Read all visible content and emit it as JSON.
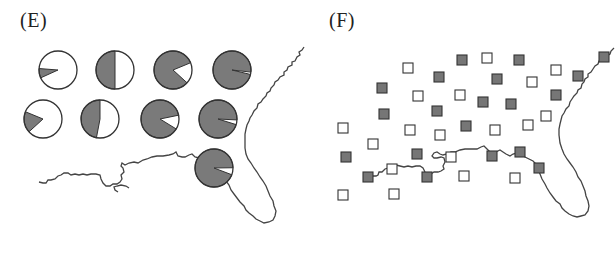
{
  "panels": {
    "e": {
      "label": "(E)",
      "description": "Pie chart markers over a coastline map of the southeastern US; gray = allele/trait frequency fraction, white = remainder",
      "colors": {
        "filled": "#7a7a7a",
        "empty": "#ffffff",
        "stroke": "#333333",
        "coast": "#444444"
      },
      "pies": [
        {
          "cx": 58,
          "cy": 70,
          "r": 19,
          "gray_fraction": 0.08,
          "gray_start_deg": 180
        },
        {
          "cx": 115,
          "cy": 70,
          "r": 19,
          "gray_fraction": 0.5,
          "gray_start_deg": 90
        },
        {
          "cx": 173,
          "cy": 70,
          "r": 19,
          "gray_fraction": 0.82,
          "gray_start_deg": 0
        },
        {
          "cx": 232,
          "cy": 70,
          "r": 19,
          "gray_fraction": 0.98,
          "gray_start_deg": 0
        },
        {
          "cx": 43,
          "cy": 119,
          "r": 19,
          "gray_fraction": 0.18,
          "gray_start_deg": 180
        },
        {
          "cx": 100,
          "cy": 119,
          "r": 19,
          "gray_fraction": 0.47,
          "gray_start_deg": 90
        },
        {
          "cx": 160,
          "cy": 119,
          "r": 19,
          "gray_fraction": 0.88,
          "gray_start_deg": 0
        },
        {
          "cx": 218,
          "cy": 119,
          "r": 19,
          "gray_fraction": 0.96,
          "gray_start_deg": 0
        },
        {
          "cx": 214,
          "cy": 168,
          "r": 19,
          "gray_fraction": 0.94,
          "gray_start_deg": 0
        }
      ]
    },
    "f": {
      "label": "(F)",
      "description": "Square markers over the same coastline map; filled gray squares vs open white squares, randomly interspersed",
      "colors": {
        "filled": "#767676",
        "empty": "#ffffff",
        "stroke": "#333333",
        "coast": "#444444"
      },
      "square_size": 10,
      "squares": [
        {
          "x": 98,
          "y": 63,
          "filled": false
        },
        {
          "x": 152,
          "y": 55,
          "filled": true
        },
        {
          "x": 177,
          "y": 53,
          "filled": false
        },
        {
          "x": 209,
          "y": 55,
          "filled": true
        },
        {
          "x": 294,
          "y": 52,
          "filled": true
        },
        {
          "x": 129,
          "y": 72,
          "filled": true
        },
        {
          "x": 187,
          "y": 74,
          "filled": true
        },
        {
          "x": 246,
          "y": 65,
          "filled": false
        },
        {
          "x": 268,
          "y": 71,
          "filled": true
        },
        {
          "x": 222,
          "y": 77,
          "filled": false
        },
        {
          "x": 72,
          "y": 83,
          "filled": true
        },
        {
          "x": 108,
          "y": 91,
          "filled": false
        },
        {
          "x": 150,
          "y": 90,
          "filled": false
        },
        {
          "x": 173,
          "y": 97,
          "filled": true
        },
        {
          "x": 201,
          "y": 99,
          "filled": true
        },
        {
          "x": 246,
          "y": 90,
          "filled": true
        },
        {
          "x": 74,
          "y": 109,
          "filled": true
        },
        {
          "x": 127,
          "y": 106,
          "filled": true
        },
        {
          "x": 236,
          "y": 111,
          "filled": false
        },
        {
          "x": 33,
          "y": 123,
          "filled": false
        },
        {
          "x": 100,
          "y": 125,
          "filled": false
        },
        {
          "x": 130,
          "y": 130,
          "filled": false
        },
        {
          "x": 156,
          "y": 121,
          "filled": true
        },
        {
          "x": 185,
          "y": 125,
          "filled": false
        },
        {
          "x": 218,
          "y": 120,
          "filled": false
        },
        {
          "x": 63,
          "y": 139,
          "filled": false
        },
        {
          "x": 36,
          "y": 152,
          "filled": true
        },
        {
          "x": 107,
          "y": 149,
          "filled": true
        },
        {
          "x": 141,
          "y": 152,
          "filled": false
        },
        {
          "x": 182,
          "y": 151,
          "filled": true
        },
        {
          "x": 210,
          "y": 147,
          "filled": true
        },
        {
          "x": 82,
          "y": 164,
          "filled": false
        },
        {
          "x": 229,
          "y": 163,
          "filled": true
        },
        {
          "x": 58,
          "y": 172,
          "filled": true
        },
        {
          "x": 117,
          "y": 172,
          "filled": true
        },
        {
          "x": 154,
          "y": 171,
          "filled": false
        },
        {
          "x": 205,
          "y": 173,
          "filled": false
        },
        {
          "x": 33,
          "y": 190,
          "filled": false
        },
        {
          "x": 84,
          "y": 189,
          "filled": false
        }
      ]
    }
  }
}
